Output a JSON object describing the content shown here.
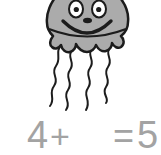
{
  "illustration": {
    "name": "jellyfish",
    "tentacle_count": 4
  },
  "equation": {
    "addend": "4",
    "plus": "+",
    "blank": "",
    "equals": "=",
    "result": "5"
  },
  "colors": {
    "background": "#ffffff",
    "jellyfish_fill": "#ababab",
    "outline": "#1c1c1c",
    "eye_fill": "#ffffff",
    "equation_text": "#a3a3a3"
  }
}
